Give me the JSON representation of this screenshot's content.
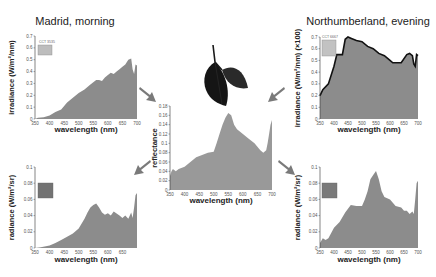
{
  "figure": {
    "titles": {
      "madrid": "Madrid, morning",
      "northumberland": "Northumberland, evening"
    },
    "colors": {
      "fill": "#8c8c8c",
      "fill_light": "#999999",
      "arrow": "#7a7a7a",
      "outline": "#111111",
      "swatch_madrid_top": "#bdbdbd",
      "swatch_north_top": "#c2c2c2",
      "swatch_madrid_bottom": "#737373",
      "swatch_north_bottom": "#7a7a7a",
      "leaf": "#1a1a1a"
    },
    "labels": {
      "cct_madrid": "CCT 3535",
      "cct_north": "CCT 6667",
      "xlabel": "wavelength (nm)"
    }
  },
  "chart_data": [
    {
      "id": "madrid-irradiance",
      "type": "area",
      "title": "Madrid, morning",
      "xlabel": "wavelength (nm)",
      "ylabel": "irradiance (W/m²/nm)",
      "xlim": [
        350,
        700
      ],
      "ylim": [
        0,
        0.7
      ],
      "xticks": [
        "350",
        "400",
        "450",
        "500",
        "550",
        "600",
        "650",
        "700"
      ],
      "yticks": [
        "0",
        "0.1",
        "0.2",
        "0.3",
        "0.4",
        "0.5",
        "0.6",
        "0.7"
      ],
      "x": [
        350,
        360,
        380,
        400,
        420,
        440,
        460,
        480,
        500,
        520,
        540,
        550,
        560,
        570,
        580,
        590,
        600,
        610,
        620,
        630,
        640,
        650,
        660,
        670,
        680,
        685,
        690,
        695,
        700
      ],
      "values": [
        0.0,
        0.01,
        0.015,
        0.03,
        0.06,
        0.08,
        0.14,
        0.18,
        0.22,
        0.25,
        0.29,
        0.31,
        0.33,
        0.33,
        0.32,
        0.35,
        0.37,
        0.39,
        0.38,
        0.4,
        0.42,
        0.44,
        0.46,
        0.5,
        0.51,
        0.42,
        0.38,
        0.46,
        0.45
      ],
      "grid": false
    },
    {
      "id": "northumberland-irradiance",
      "type": "area",
      "title": "Northumberland, evening",
      "xlabel": "wavelength (nm)",
      "ylabel": "irradiance (W/m²/nm) (×100)",
      "xlim": [
        350,
        700
      ],
      "ylim": [
        0,
        0.7
      ],
      "xticks": [
        "350",
        "400",
        "450",
        "500",
        "550",
        "600",
        "650",
        "700"
      ],
      "yticks": [
        "0",
        "0.1",
        "0.2",
        "0.3",
        "0.4",
        "0.5",
        "0.6",
        "0.7"
      ],
      "x": [
        350,
        360,
        380,
        400,
        410,
        420,
        430,
        440,
        450,
        460,
        480,
        500,
        520,
        540,
        560,
        580,
        600,
        610,
        620,
        640,
        660,
        670,
        680,
        685,
        690,
        695,
        700
      ],
      "values": [
        0.2,
        0.25,
        0.3,
        0.45,
        0.55,
        0.55,
        0.55,
        0.68,
        0.7,
        0.69,
        0.67,
        0.66,
        0.62,
        0.6,
        0.56,
        0.54,
        0.5,
        0.48,
        0.48,
        0.48,
        0.55,
        0.56,
        0.54,
        0.47,
        0.45,
        0.55,
        0.54
      ],
      "grid": false
    },
    {
      "id": "leaf-reflectance",
      "type": "area",
      "xlabel": "wavelength (nm)",
      "ylabel": "reflectance",
      "xlim": [
        350,
        700
      ],
      "ylim": [
        0,
        0.18
      ],
      "xticks": [
        "350",
        "400",
        "450",
        "500",
        "550",
        "600",
        "650",
        "700"
      ],
      "yticks": [
        "0",
        "0.02",
        "0.04",
        "0.06",
        "0.08",
        "0.1",
        "0.12",
        "0.14",
        "0.16",
        "0.18"
      ],
      "x": [
        350,
        355,
        360,
        370,
        380,
        400,
        420,
        440,
        460,
        480,
        500,
        510,
        520,
        530,
        540,
        550,
        560,
        570,
        580,
        600,
        620,
        640,
        660,
        670,
        680,
        685,
        690,
        695,
        700
      ],
      "values": [
        0.03,
        0.04,
        0.045,
        0.04,
        0.045,
        0.05,
        0.06,
        0.07,
        0.075,
        0.08,
        0.082,
        0.1,
        0.12,
        0.14,
        0.155,
        0.165,
        0.16,
        0.14,
        0.13,
        0.12,
        0.11,
        0.1,
        0.085,
        0.08,
        0.085,
        0.1,
        0.12,
        0.14,
        0.15
      ],
      "grid": false
    },
    {
      "id": "madrid-radiance",
      "type": "area",
      "xlabel": "wavelength (nm)",
      "ylabel": "radiance (W/m²/sr)",
      "xlim": [
        350,
        700
      ],
      "ylim": [
        0,
        0.1
      ],
      "xticks": [
        "350",
        "400",
        "450",
        "500",
        "550",
        "600",
        "650"
      ],
      "yticks": [
        "0",
        "0.02",
        "0.04",
        "0.06",
        "0.08",
        "0.1"
      ],
      "x": [
        350,
        370,
        400,
        420,
        440,
        460,
        480,
        500,
        520,
        530,
        540,
        550,
        560,
        570,
        580,
        590,
        600,
        610,
        620,
        640,
        650,
        660,
        670,
        680,
        685,
        690,
        695,
        700
      ],
      "values": [
        0.0,
        0.001,
        0.003,
        0.006,
        0.01,
        0.014,
        0.018,
        0.024,
        0.036,
        0.044,
        0.05,
        0.053,
        0.055,
        0.05,
        0.044,
        0.041,
        0.043,
        0.04,
        0.045,
        0.04,
        0.037,
        0.04,
        0.036,
        0.044,
        0.037,
        0.05,
        0.065,
        0.068
      ],
      "grid": false
    },
    {
      "id": "northumberland-radiance",
      "type": "area",
      "xlabel": "wavelength (nm)",
      "ylabel": "radiance (W/m²/sr)",
      "xlim": [
        350,
        700
      ],
      "ylim": [
        0,
        0.1
      ],
      "xticks": [
        "350",
        "400",
        "450",
        "500",
        "550",
        "600",
        "650",
        "700"
      ],
      "yticks": [
        "0",
        "0.02",
        "0.04",
        "0.06",
        "0.08",
        "0.1"
      ],
      "x": [
        350,
        360,
        370,
        380,
        400,
        420,
        440,
        460,
        480,
        500,
        510,
        520,
        530,
        540,
        550,
        560,
        570,
        580,
        600,
        620,
        640,
        650,
        660,
        670,
        680,
        685,
        690,
        695,
        700
      ],
      "values": [
        0.006,
        0.012,
        0.01,
        0.012,
        0.025,
        0.032,
        0.044,
        0.053,
        0.052,
        0.052,
        0.06,
        0.07,
        0.085,
        0.09,
        0.095,
        0.085,
        0.07,
        0.063,
        0.06,
        0.052,
        0.05,
        0.046,
        0.046,
        0.042,
        0.045,
        0.042,
        0.06,
        0.08,
        0.083
      ],
      "grid": false
    }
  ]
}
